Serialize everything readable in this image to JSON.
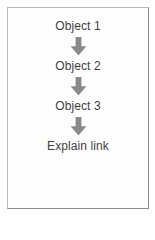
{
  "diagram": {
    "title_text": null,
    "background_color": "#ffffff",
    "box": {
      "border_color": "#b9b9b9",
      "fill_color": "#fefefe"
    },
    "arrow": {
      "icon": "arrow-down-icon",
      "color": "#8a8a8a",
      "glyph": "↓"
    },
    "text_color": "#3f3f3f",
    "nodes": [
      {
        "label": "Object 1"
      },
      {
        "label": "Object 2"
      },
      {
        "label": "Object 3"
      },
      {
        "label": "Explain link"
      }
    ],
    "connectors": [
      {
        "from": "Object 1",
        "to": "Object 2",
        "direction": "down"
      },
      {
        "from": "Object 2",
        "to": "Object 3",
        "direction": "down"
      },
      {
        "from": "Object 3",
        "to": "Explain link",
        "direction": "down"
      }
    ]
  }
}
